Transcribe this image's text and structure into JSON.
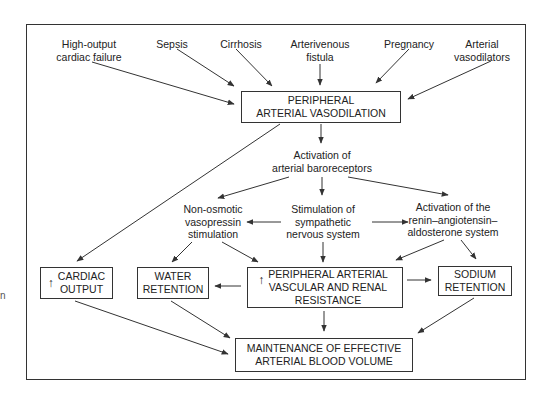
{
  "diagram": {
    "type": "flowchart",
    "causes": [
      {
        "id": "high-output-cardiac-failure",
        "label": "High-output\ncardiac failure"
      },
      {
        "id": "sepsis",
        "label": "Sepsis"
      },
      {
        "id": "cirrhosis",
        "label": "Cirrhosis"
      },
      {
        "id": "arterivenous-fistula",
        "label": "Arterivenous\nfistula"
      },
      {
        "id": "pregnancy",
        "label": "Pregnancy"
      },
      {
        "id": "arterial-vasodilators",
        "label": "Arterial\nvasodilators"
      }
    ],
    "central_box": {
      "label": "PERIPHERAL\nARTERIAL VASODILATION"
    },
    "baroreceptors": {
      "label": "Activation of\narterial baroreceptors"
    },
    "mechanisms": [
      {
        "id": "non-osmotic-vasopressin",
        "label": "Non-osmotic\nvasopressin\nstimulation"
      },
      {
        "id": "sympathetic",
        "label": "Stimulation of\nsympathetic\nnervous system"
      },
      {
        "id": "raas",
        "label": "Activation of the\nrenin–angiotensin–\naldosterone system"
      }
    ],
    "effects": [
      {
        "id": "cardiac-output",
        "arrow": "↑",
        "label": "CARDIAC\nOUTPUT"
      },
      {
        "id": "water-retention",
        "label": "WATER\nRETENTION"
      },
      {
        "id": "pavrr",
        "arrow": "↑",
        "label": "PERIPHERAL ARTERIAL\nVASCULAR AND RENAL\nRESISTANCE"
      },
      {
        "id": "sodium-retention",
        "label": "SODIUM\nRETENTION"
      }
    ],
    "outcome": {
      "label": "MAINTENANCE OF EFFECTIVE\nARTERIAL BLOOD VOLUME"
    },
    "margin_fragment": "n",
    "edges": [
      [
        "high-output-cardiac-failure",
        "central_box"
      ],
      [
        "sepsis",
        "central_box"
      ],
      [
        "cirrhosis",
        "central_box"
      ],
      [
        "arterivenous-fistula",
        "central_box"
      ],
      [
        "pregnancy",
        "central_box"
      ],
      [
        "arterial-vasodilators",
        "central_box"
      ],
      [
        "central_box",
        "baroreceptors"
      ],
      [
        "central_box",
        "cardiac-output"
      ],
      [
        "baroreceptors",
        "non-osmotic-vasopressin"
      ],
      [
        "baroreceptors",
        "sympathetic"
      ],
      [
        "baroreceptors",
        "raas"
      ],
      [
        "sympathetic",
        "non-osmotic-vasopressin"
      ],
      [
        "sympathetic",
        "raas"
      ],
      [
        "sympathetic",
        "pavrr"
      ],
      [
        "non-osmotic-vasopressin",
        "water-retention"
      ],
      [
        "non-osmotic-vasopressin",
        "pavrr"
      ],
      [
        "raas",
        "pavrr"
      ],
      [
        "raas",
        "sodium-retention"
      ],
      [
        "pavrr",
        "water-retention"
      ],
      [
        "pavrr",
        "sodium-retention"
      ],
      [
        "pavrr",
        "outcome"
      ],
      [
        "cardiac-output",
        "outcome"
      ],
      [
        "water-retention",
        "outcome"
      ],
      [
        "sodium-retention",
        "outcome"
      ]
    ],
    "colors": {
      "line": "#333333",
      "text": "#222222",
      "background": "#ffffff"
    }
  }
}
